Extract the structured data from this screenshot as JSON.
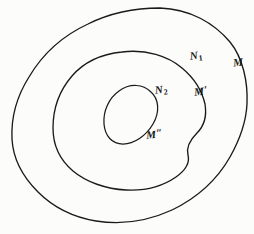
{
  "figure": {
    "kind": "hand-drawn-diagram",
    "background_color": "#fcfcfa",
    "ink_color": "#1a1a1a",
    "width": 254,
    "height": 234
  },
  "labels": {
    "outer_curve": {
      "text": "M",
      "name": "label-M"
    },
    "outer_region": {
      "text": "N",
      "subscript": "1",
      "name": "label-N1"
    },
    "middle_curve": {
      "text": "M",
      "prime": "′",
      "name": "label-M-prime"
    },
    "middle_region": {
      "text": "N",
      "subscript": "2",
      "name": "label-N2"
    },
    "inner_curve": {
      "text": "M",
      "prime": "″",
      "name": "label-M-double-prime"
    }
  },
  "curves": {
    "outer": {
      "name": "M",
      "path": "M 160,8 C 190,9 214,23 230,42 C 243,58 248,82 247,104 C 246,124 239,141 230,157 C 218,178 199,197 172,210 C 148,221 121,225 96,221 C 72,217 52,206 38,192 C 22,176 13,158 12,139 C 11,118 17,96 29,77 C 42,55 62,36 88,24 C 110,13 135,8 160,8 Z"
    },
    "middle": {
      "name": "M-prime",
      "path": "M 122,52 C 146,49 168,56 182,68 C 194,78 202,91 205,104 C 207,116 204,126 197,133 C 190,140 186,147 188,155 C 190,163 186,170 176,177 C 163,186 145,191 126,190 C 106,189 86,182 73,171 C 60,160 53,145 53,128 C 53,109 59,91 72,76 C 84,62 102,54 122,52 Z"
    },
    "inner": {
      "name": "M-double-prime",
      "path": "M 151,92 C 159,99 160,112 153,124 C 146,136 134,144 123,144 C 112,144 105,136 104,124 C 103,111 109,98 119,91 C 130,83 143,84 151,92 Z"
    }
  }
}
